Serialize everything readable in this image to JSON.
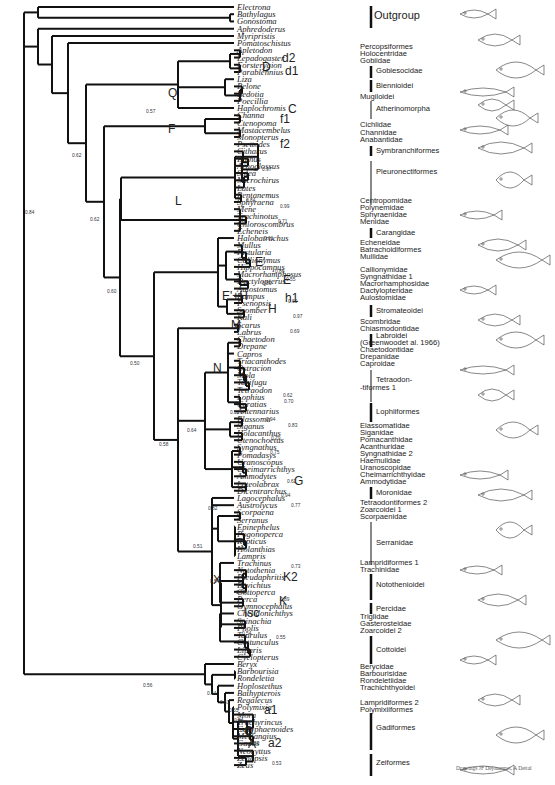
{
  "figure": {
    "type": "phylogenetic-tree",
    "credit": "Drawings JF Dejouannet, A Dettaï"
  },
  "taxa": [
    "Electrona",
    "Bathylagus",
    "Gonostoma",
    "Aphredoderus",
    "Myripristis",
    "Pomatoschistus",
    "Apletodon",
    "Lepadogaster",
    "Forsterygion",
    "Parablennius",
    "Liza",
    "Belone",
    "Bedotia",
    "Poecillia",
    "Haplochromis",
    "Channa",
    "Ctenopoma",
    "Mastacembelus",
    "Monopterus",
    "Psettodes",
    "Citharus",
    "Bothus",
    "Arnoglossus",
    "Solea",
    "Microchirus",
    "Lates",
    "Pentanemus",
    "Sphyraena",
    "Mene",
    "Trachinotus",
    "Chloroscombrus",
    "Echeneis",
    "Halobatrachus",
    "Mullus",
    "Fistularia",
    "Callionymus",
    "Hippocampus",
    "Macrorhamphosus",
    "Dactylopterus",
    "Aulostomus",
    "Pampus",
    "Psenopsis",
    "Scomber",
    "Kali",
    "Scarus",
    "Labrus",
    "Chaetodon",
    "Drepane",
    "Capros",
    "Triacanthodes",
    "Ostracion",
    "Mola",
    "Takifugu",
    "Tetraodon",
    "Lophius",
    "Ceratias",
    "Antennarius",
    "Elassoma",
    "Siganus",
    "Holacanthus",
    "Ctenochoetus",
    "Syngnathus",
    "Pomadasys",
    "Uranoscopus",
    "Cheimarrichthys",
    "Ammodytes",
    "Lateolabrax",
    "Dicentrarchus",
    "Lagocephalus",
    "Austrolycus",
    "Scorpaena",
    "Serranus",
    "Epinephelus",
    "Pogonoperca",
    "Rypticus",
    "Holanthias",
    "Lampris",
    "Trachinus",
    "Notothenia",
    "Pseudaphritis",
    "Bovichtus",
    "Cottoperca",
    "Perca",
    "Gymnocephalus",
    "Chelidonichthys",
    "Spinachia",
    "Pholis",
    "Taurulus",
    "Cottunculus",
    "Liparis",
    "Cyclopterus",
    "Beryx",
    "Barbourisia",
    "Rondeletia",
    "Hoplostethus",
    "Bathypterois",
    "Regalecus",
    "Polymixia",
    "Mora",
    "Trachyrincus",
    "Coryphaenoides",
    "Merlangius",
    "Gadus",
    "Neocyttus",
    "Zenopsis",
    "Zeus"
  ],
  "groups": [
    {
      "label": "Outgroup",
      "y": 15,
      "bar": [
        6,
        28
      ],
      "bold": true
    },
    {
      "label": "Percopsiformes",
      "y": 47
    },
    {
      "label": "Holocentridae",
      "y": 54
    },
    {
      "label": "Gobiidae",
      "y": 61
    },
    {
      "label": "Gobiesocidae",
      "y": 71,
      "bar": [
        66,
        78
      ]
    },
    {
      "label": "Blennioidei",
      "y": 86,
      "bar": [
        80,
        92
      ]
    },
    {
      "label": "Mugiloidei",
      "y": 97
    },
    {
      "label": "Atherinomorpha",
      "y": 109,
      "bar": [
        101,
        119
      ]
    },
    {
      "label": "Cichlidae",
      "y": 125
    },
    {
      "label": "Channidae",
      "y": 133
    },
    {
      "label": "Anabantidae",
      "y": 140
    },
    {
      "label": "Symbranchiformes",
      "y": 151,
      "bar": [
        146,
        156
      ]
    },
    {
      "label": "Pleuronectiformes",
      "y": 172,
      "bar": [
        161,
        205
      ]
    },
    {
      "label": "Centropomidae",
      "y": 201
    },
    {
      "label": "Polynemidae",
      "y": 208
    },
    {
      "label": "Sphyraenidae",
      "y": 215
    },
    {
      "label": "Menidae",
      "y": 222
    },
    {
      "label": "Carangidae",
      "y": 233,
      "bar": [
        228,
        238
      ]
    },
    {
      "label": "Echeneidae",
      "y": 243
    },
    {
      "label": "Batrachoidiformes",
      "y": 250
    },
    {
      "label": "Mullidae",
      "y": 257
    },
    {
      "label": "Callionymidae",
      "y": 270
    },
    {
      "label": "Syngnathidae 1",
      "y": 277
    },
    {
      "label": "Macrorhamphosidae",
      "y": 284
    },
    {
      "label": "Dactylopteridae",
      "y": 291
    },
    {
      "label": "Aulostomidae",
      "y": 298
    },
    {
      "label": "Stromateoidei",
      "y": 311,
      "bar": [
        305,
        317
      ]
    },
    {
      "label": "Scombridae",
      "y": 322
    },
    {
      "label": "Chiasmodontidae",
      "y": 329
    },
    {
      "label": "Labroidei",
      "y": 336,
      "bar": [
        334,
        347
      ]
    },
    {
      "label": "(Greenwoodet al. 1966)",
      "y": 343
    },
    {
      "label": "Chaetodontidae",
      "y": 350
    },
    {
      "label": "Drepanidae",
      "y": 357
    },
    {
      "label": "Caproidae",
      "y": 364
    },
    {
      "label": "Tetraodon-",
      "y": 380,
      "bar": [
        370,
        402
      ]
    },
    {
      "label": "-tiformes 1",
      "y": 388
    },
    {
      "label": "Lophiiformes",
      "y": 412,
      "bar": [
        403,
        422
      ]
    },
    {
      "label": "Elassomatidae",
      "y": 426
    },
    {
      "label": "Siganidae",
      "y": 433
    },
    {
      "label": "Pomacanthidae",
      "y": 440
    },
    {
      "label": "Acanthuridae",
      "y": 447
    },
    {
      "label": "Syngnathidae 2",
      "y": 454
    },
    {
      "label": "Haemulidae",
      "y": 461
    },
    {
      "label": "Uranoscopidae",
      "y": 468
    },
    {
      "label": "Cheimarrichthyidae",
      "y": 475
    },
    {
      "label": "Ammodytidae",
      "y": 482
    },
    {
      "label": "Moronidae",
      "y": 493,
      "bar": [
        487,
        499
      ]
    },
    {
      "label": "Tetraodontiformes 2",
      "y": 503
    },
    {
      "label": "Zoarcoidei 1",
      "y": 510
    },
    {
      "label": "Scorpaenidae",
      "y": 517
    },
    {
      "label": "Serranidae",
      "y": 543,
      "bar": [
        522,
        565
      ]
    },
    {
      "label": "Lampridiformes 1",
      "y": 563
    },
    {
      "label": "Trachinidae",
      "y": 570
    },
    {
      "label": "Notothenioidei",
      "y": 585,
      "bar": [
        574,
        600
      ]
    },
    {
      "label": "Percidae",
      "y": 609,
      "bar": [
        603,
        614
      ]
    },
    {
      "label": "Triglidae",
      "y": 617
    },
    {
      "label": "Gasterosteidae",
      "y": 624
    },
    {
      "label": "Zoarcoidei 2",
      "y": 631
    },
    {
      "label": "Cottoidei",
      "y": 650,
      "bar": [
        636,
        664
      ]
    },
    {
      "label": "Berycidae",
      "y": 667
    },
    {
      "label": "Barbourisidae",
      "y": 674
    },
    {
      "label": "Rondeletiidae",
      "y": 681
    },
    {
      "label": "Trachichthyoidei",
      "y": 688
    },
    {
      "label": "Lampridiformes 2",
      "y": 703
    },
    {
      "label": "Polymixiiformes",
      "y": 710
    },
    {
      "label": "Gadiformes",
      "y": 728,
      "bar": [
        713,
        750
      ]
    },
    {
      "label": "Zeiformes",
      "y": 763,
      "bar": [
        754,
        776
      ]
    }
  ],
  "clades": [
    {
      "label": "D",
      "x": 262,
      "y": 71
    },
    {
      "label": "d2",
      "x": 282,
      "y": 62
    },
    {
      "label": "d1",
      "x": 285,
      "y": 75
    },
    {
      "label": "C",
      "x": 288,
      "y": 113
    },
    {
      "label": "Q",
      "x": 168,
      "y": 97
    },
    {
      "label": "F",
      "x": 168,
      "y": 133
    },
    {
      "label": "f1",
      "x": 280,
      "y": 123
    },
    {
      "label": "f2",
      "x": 280,
      "y": 148
    },
    {
      "label": "L",
      "x": 175,
      "y": 205
    },
    {
      "label": "E'",
      "x": 255,
      "y": 266
    },
    {
      "label": "E",
      "x": 283,
      "y": 284
    },
    {
      "label": "E'+H",
      "x": 222,
      "y": 300
    },
    {
      "label": "H",
      "x": 268,
      "y": 313
    },
    {
      "label": "h1",
      "x": 285,
      "y": 302
    },
    {
      "label": "M",
      "x": 231,
      "y": 329
    },
    {
      "label": "N",
      "x": 213,
      "y": 372
    },
    {
      "label": "G",
      "x": 294,
      "y": 485
    },
    {
      "label": "K2",
      "x": 283,
      "y": 581
    },
    {
      "label": "K",
      "x": 279,
      "y": 605
    },
    {
      "label": "X",
      "x": 213,
      "y": 584
    },
    {
      "label": "Isc",
      "x": 244,
      "y": 617
    },
    {
      "label": "a1",
      "x": 264,
      "y": 714
    },
    {
      "label": "a2",
      "x": 268,
      "y": 747
    },
    {
      "label": "O",
      "x": 244,
      "y": 735
    },
    {
      "label": "A",
      "x": 248,
      "y": 748
    }
  ],
  "support": [
    {
      "v": "0.57",
      "x": 146,
      "y": 108
    },
    {
      "v": "0.62",
      "x": 72,
      "y": 152
    },
    {
      "v": "0.84",
      "x": 25,
      "y": 209
    },
    {
      "v": "0.62",
      "x": 90,
      "y": 216
    },
    {
      "v": "0.60",
      "x": 107,
      "y": 288
    },
    {
      "v": "0.50",
      "x": 130,
      "y": 360
    },
    {
      "v": "0.58",
      "x": 159,
      "y": 441
    },
    {
      "v": "0.64",
      "x": 187,
      "y": 427
    },
    {
      "v": "0.51",
      "x": 230,
      "y": 409
    },
    {
      "v": "0.82",
      "x": 208,
      "y": 505
    },
    {
      "v": "0.51",
      "x": 193,
      "y": 543
    },
    {
      "v": "0.54",
      "x": 210,
      "y": 578
    },
    {
      "v": "0.99",
      "x": 236,
      "y": 589
    },
    {
      "v": "0.89",
      "x": 280,
      "y": 596
    },
    {
      "v": "0.54",
      "x": 242,
      "y": 630
    },
    {
      "v": "0.55",
      "x": 276,
      "y": 634
    },
    {
      "v": "0.56",
      "x": 143,
      "y": 682
    },
    {
      "v": "0.54",
      "x": 207,
      "y": 690
    },
    {
      "v": "0.51",
      "x": 220,
      "y": 699
    },
    {
      "v": "0.55",
      "x": 229,
      "y": 707
    },
    {
      "v": "0.54",
      "x": 234,
      "y": 717
    },
    {
      "v": "0.53",
      "x": 240,
      "y": 727
    },
    {
      "v": "0.53",
      "x": 250,
      "y": 740
    },
    {
      "v": "0.53",
      "x": 272,
      "y": 760
    },
    {
      "v": "0.97",
      "x": 262,
      "y": 166
    },
    {
      "v": "0.84",
      "x": 246,
      "y": 197
    },
    {
      "v": "0.99",
      "x": 280,
      "y": 203
    },
    {
      "v": "0.71",
      "x": 278,
      "y": 218
    },
    {
      "v": "0.61",
      "x": 264,
      "y": 235
    },
    {
      "v": "0.83",
      "x": 262,
      "y": 280
    },
    {
      "v": "0.86",
      "x": 275,
      "y": 268
    },
    {
      "v": "0.55",
      "x": 286,
      "y": 276
    },
    {
      "v": "0.60",
      "x": 288,
      "y": 298
    },
    {
      "v": "0.97",
      "x": 293,
      "y": 313
    },
    {
      "v": "0.69",
      "x": 290,
      "y": 328
    },
    {
      "v": "0.62",
      "x": 283,
      "y": 392
    },
    {
      "v": "0.70",
      "x": 284,
      "y": 398
    },
    {
      "v": "0.94",
      "x": 266,
      "y": 416
    },
    {
      "v": "0.83",
      "x": 288,
      "y": 422
    },
    {
      "v": "0.79",
      "x": 271,
      "y": 435
    },
    {
      "v": "0.75",
      "x": 270,
      "y": 449
    },
    {
      "v": "0.62",
      "x": 287,
      "y": 478
    },
    {
      "v": "0.94",
      "x": 281,
      "y": 492
    },
    {
      "v": "0.77",
      "x": 291,
      "y": 502
    },
    {
      "v": "0.73",
      "x": 291,
      "y": 563
    }
  ]
}
